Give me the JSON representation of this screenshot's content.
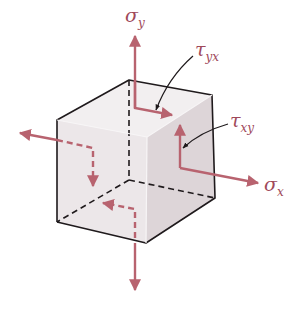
{
  "diagram": {
    "type": "stress-element-cube",
    "colors": {
      "arrow": "#b8636f",
      "edge": "#1f1a1c",
      "leader": "#1f1a1c",
      "face_top": "#f2eff0",
      "face_front": "#ece7e9",
      "face_right": "#ddd5d8",
      "label": "#a0495a"
    },
    "labels": {
      "sigma_y": {
        "symbol": "σ",
        "subscript": "y"
      },
      "sigma_x": {
        "symbol": "σ",
        "subscript": "x"
      },
      "tau_yx": {
        "symbol": "τ",
        "subscript": "yx"
      },
      "tau_xy": {
        "symbol": "τ",
        "subscript": "xy"
      }
    }
  }
}
